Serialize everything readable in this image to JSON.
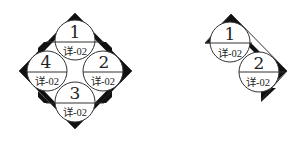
{
  "figures": [
    {
      "name": "full-diamond-index-symbol",
      "circles": [
        {
          "number": "1",
          "ref": "详-02"
        },
        {
          "number": "2",
          "ref": "详-02"
        },
        {
          "number": "3",
          "ref": "详-02"
        },
        {
          "number": "4",
          "ref": "详-02"
        }
      ]
    },
    {
      "name": "half-diamond-index-symbol",
      "circles": [
        {
          "number": "1",
          "ref": "详-02"
        },
        {
          "number": "2",
          "ref": "详-02"
        }
      ]
    }
  ],
  "colors": {
    "line": "#333333",
    "wedge": "#111111",
    "background": "#ffffff"
  }
}
